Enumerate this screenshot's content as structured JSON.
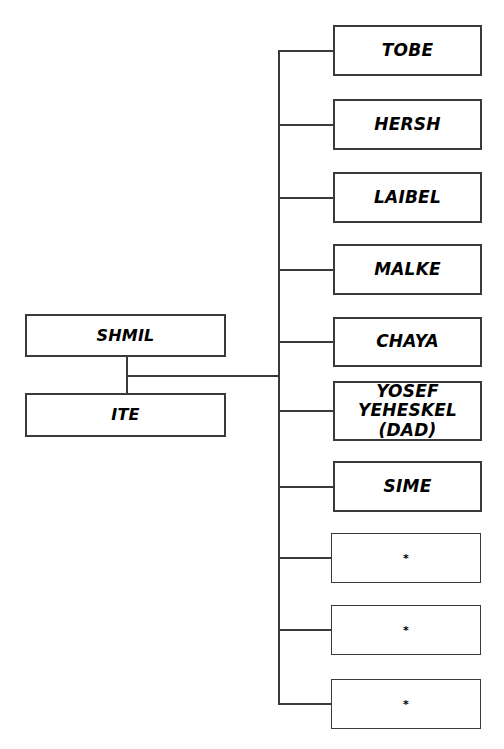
{
  "diagram": {
    "type": "family-tree",
    "background_color": "#ffffff",
    "line_color": "#3a3a3a",
    "text_color": "#000000"
  },
  "parents": [
    {
      "id": "shmil",
      "label": "SHMIL",
      "x": 25,
      "y": 314,
      "w": 201,
      "h": 43
    },
    {
      "id": "ite",
      "label": "ITE",
      "x": 25,
      "y": 393,
      "w": 201,
      "h": 44
    }
  ],
  "children": [
    {
      "id": "tobe",
      "label": "TOBE",
      "x": 333,
      "y": 25,
      "w": 149,
      "h": 51,
      "thin": false,
      "unnamed": false
    },
    {
      "id": "hersh",
      "label": "HERSH",
      "x": 333,
      "y": 99,
      "w": 149,
      "h": 51,
      "thin": false,
      "unnamed": false
    },
    {
      "id": "laibel",
      "label": "LAIBEL",
      "x": 333,
      "y": 172,
      "w": 149,
      "h": 51,
      "thin": false,
      "unnamed": false
    },
    {
      "id": "malke",
      "label": "MALKE",
      "x": 333,
      "y": 244,
      "w": 149,
      "h": 51,
      "thin": false,
      "unnamed": false
    },
    {
      "id": "chaya",
      "label": "CHAYA",
      "x": 333,
      "y": 317,
      "w": 149,
      "h": 50,
      "thin": false,
      "unnamed": false
    },
    {
      "id": "yosef",
      "label": "YOSEF\nYEHESKEL\n(DAD)",
      "x": 333,
      "y": 381,
      "w": 149,
      "h": 60,
      "thin": false,
      "unnamed": false
    },
    {
      "id": "sime",
      "label": "SIME",
      "x": 333,
      "y": 461,
      "w": 149,
      "h": 51,
      "thin": false,
      "unnamed": false
    },
    {
      "id": "star1",
      "label": "*",
      "x": 331,
      "y": 533,
      "w": 150,
      "h": 50,
      "thin": true,
      "unnamed": true
    },
    {
      "id": "star2",
      "label": "*",
      "x": 331,
      "y": 605,
      "w": 150,
      "h": 50,
      "thin": true,
      "unnamed": true
    },
    {
      "id": "star3",
      "label": "*",
      "x": 331,
      "y": 679,
      "w": 150,
      "h": 50,
      "thin": true,
      "unnamed": true
    }
  ],
  "connectors": {
    "parent_join_x": 126,
    "parent_join_top": 356,
    "parent_join_bottom": 394,
    "parent_to_spine_y": 375,
    "spine_x": 278,
    "spine_top": 50,
    "spine_bottom": 704,
    "stub_length": 55
  },
  "legend": {
    "asterisk_meaning": "*"
  }
}
